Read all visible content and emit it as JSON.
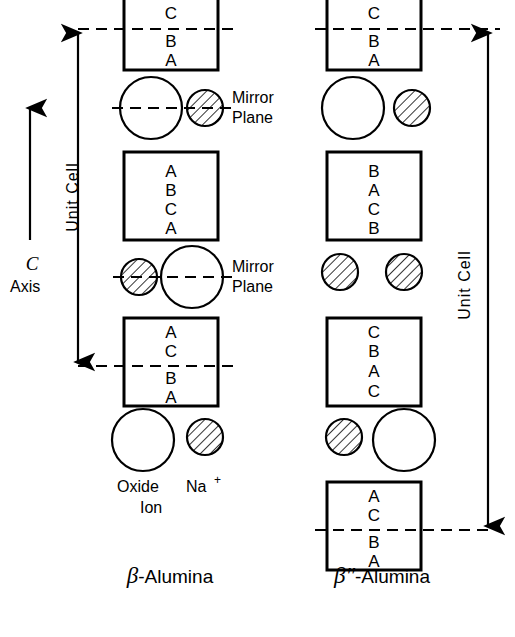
{
  "figure": {
    "background_color": "#ffffff",
    "ink_color": "#000000"
  },
  "axis": {
    "symbol": "C",
    "label": "Axis",
    "direction": "up"
  },
  "unit_cell_labels": {
    "left": "Unit Cell",
    "right": "Unit Cell"
  },
  "mirror_plane_labels": [
    {
      "line1": "Mirror",
      "line2": "Plane"
    },
    {
      "line1": "Mirror",
      "line2": "Plane"
    }
  ],
  "legend": {
    "oxide": {
      "line1": "Oxide",
      "line2": "Ion",
      "style": "open-circle"
    },
    "sodium": {
      "line1": "Na",
      "superscript": "+",
      "style": "hatched-circle"
    }
  },
  "captions": {
    "left": {
      "greek": "β",
      "primes": "",
      "rest": "-Alumina"
    },
    "right": {
      "greek": "β",
      "primes": "″",
      "rest": "-Alumina"
    }
  },
  "left_column": {
    "name": "beta-alumina",
    "blocks": [
      {
        "id": "block-1",
        "letters": [
          "A",
          "C",
          "B",
          "A"
        ],
        "mirror_after_index": 1
      },
      {
        "id": "block-2",
        "letters": [
          "A",
          "B",
          "C",
          "A"
        ],
        "mirror_after_index": -1
      },
      {
        "id": "block-3",
        "letters": [
          "A",
          "C",
          "B",
          "A"
        ],
        "mirror_after_index": 1
      }
    ],
    "interlayers": [
      {
        "id": "interlayer-1",
        "ions": [
          "oxide",
          "sodium"
        ],
        "mirror_plane": true,
        "mirror_label": true
      },
      {
        "id": "interlayer-2",
        "ions": [
          "sodium",
          "oxide"
        ],
        "mirror_plane": true,
        "mirror_label": true
      },
      {
        "id": "interlayer-3",
        "ions": [
          "oxide",
          "sodium"
        ],
        "mirror_plane": false,
        "mirror_label": false
      }
    ]
  },
  "right_column": {
    "name": "beta-double-prime-alumina",
    "blocks": [
      {
        "id": "block-1",
        "letters": [
          "A",
          "C",
          "B",
          "A"
        ],
        "mirror_after_index": 1
      },
      {
        "id": "block-2",
        "letters": [
          "B",
          "A",
          "C",
          "B"
        ],
        "mirror_after_index": -1
      },
      {
        "id": "block-3",
        "letters": [
          "C",
          "B",
          "A",
          "C"
        ],
        "mirror_after_index": -1
      },
      {
        "id": "block-4",
        "letters": [
          "A",
          "C",
          "B",
          "A"
        ],
        "mirror_after_index": 1
      }
    ],
    "interlayers": [
      {
        "id": "interlayer-1",
        "ions": [
          "oxide",
          "sodium"
        ],
        "mirror_plane": false
      },
      {
        "id": "interlayer-2",
        "ions": [
          "sodium",
          "sodium"
        ],
        "mirror_plane": false
      },
      {
        "id": "interlayer-3",
        "ions": [
          "sodium",
          "oxide"
        ],
        "mirror_plane": false
      }
    ]
  }
}
